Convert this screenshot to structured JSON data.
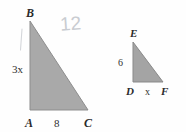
{
  "figure": {
    "background_color": "#fefefe",
    "fill_color": "#a8a8a8",
    "stroke_color": "#8f8f8f",
    "label_color": "#2b2b2b",
    "annotation_color": "#c9ccd1"
  },
  "triangle_left": {
    "name": "triangle-ABC",
    "vertices": {
      "B": "B",
      "A": "A",
      "C": "C"
    },
    "sides": {
      "vertical_leg": "3x",
      "horizontal_leg": "8"
    },
    "geometry": {
      "apex_x": 30,
      "apex_y": 21,
      "bottom_left_x": 30,
      "bottom_left_y": 110,
      "bottom_right_x": 88,
      "bottom_right_y": 110
    }
  },
  "triangle_right": {
    "name": "triangle-DEF",
    "vertices": {
      "E": "E",
      "D": "D",
      "F": "F"
    },
    "sides": {
      "vertical_leg": "6",
      "horizontal_leg": "x"
    },
    "geometry": {
      "apex_x": 133,
      "apex_y": 42,
      "bottom_left_x": 133,
      "bottom_left_y": 82,
      "bottom_right_x": 163,
      "bottom_right_y": 82
    }
  },
  "annotations": {
    "handwritten_number": "12"
  }
}
